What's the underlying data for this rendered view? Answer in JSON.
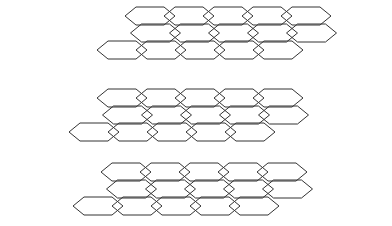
{
  "figure": {
    "background_color": "#ffffff",
    "stroke_color": "#333333",
    "stroke_width": 1,
    "canvas": {
      "width": 392,
      "height": 226
    },
    "structure_count": 3
  },
  "lattice_geometry": {
    "hex_width": 50,
    "hex_half_height": 9,
    "hex_point_inset": 11,
    "row_vertical_step": 17,
    "row_horizontal_shift": -14,
    "row_count": 3,
    "note": "Elongated hexagons with pointed left/right vertices; each lower row shifts left to suggest depth"
  },
  "structures": [
    {
      "name": "structure-top",
      "label": "Top nanoribbon",
      "origin_x": 150,
      "origin_y": 16,
      "rows": [
        {
          "label": "row-back",
          "x": 0,
          "y": 0,
          "columns": 5,
          "half_offset": false
        },
        {
          "label": "row-middle",
          "x": -14,
          "y": 17,
          "columns": 5,
          "half_offset": true
        },
        {
          "label": "row-front",
          "x": -28,
          "y": 34,
          "columns": 5,
          "half_offset": false
        }
      ]
    },
    {
      "name": "structure-middle",
      "label": "Middle nanoribbon",
      "origin_x": 122,
      "origin_y": 98,
      "rows": [
        {
          "label": "row-back",
          "x": 0,
          "y": 0,
          "columns": 5,
          "half_offset": false
        },
        {
          "label": "row-middle",
          "x": -14,
          "y": 17,
          "columns": 5,
          "half_offset": true
        },
        {
          "label": "row-front",
          "x": -28,
          "y": 34,
          "columns": 5,
          "half_offset": false
        }
      ]
    },
    {
      "name": "structure-bottom",
      "label": "Bottom nanoribbon",
      "origin_x": 126,
      "origin_y": 172,
      "rows": [
        {
          "label": "row-back",
          "x": 0,
          "y": 0,
          "columns": 5,
          "half_offset": false
        },
        {
          "label": "row-middle",
          "x": -14,
          "y": 17,
          "columns": 5,
          "half_offset": true
        },
        {
          "label": "row-front",
          "x": -28,
          "y": 34,
          "columns": 5,
          "half_offset": false
        }
      ]
    }
  ]
}
